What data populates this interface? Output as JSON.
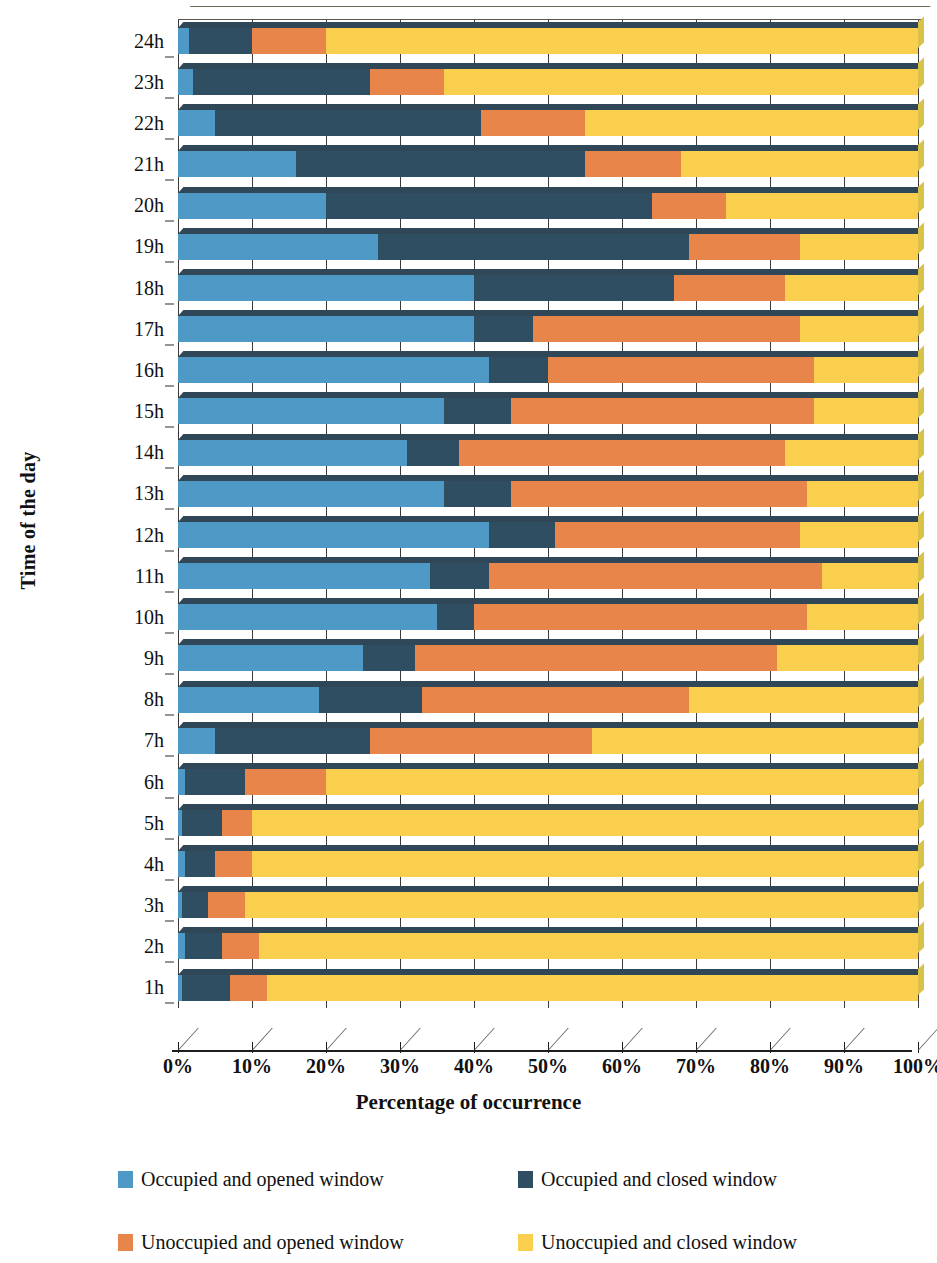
{
  "chart_data": {
    "type": "bar",
    "orientation": "horizontal",
    "stacked": true,
    "normalized_percent": true,
    "title": "",
    "xlabel": "Percentage of occurrence",
    "ylabel": "Time of the day",
    "xlim": [
      0,
      100
    ],
    "grid": true,
    "legend_position": "bottom",
    "xticks": [
      "0%",
      "10%",
      "20%",
      "30%",
      "40%",
      "50%",
      "60%",
      "70%",
      "80%",
      "90%",
      "100%"
    ],
    "xtick_values": [
      0,
      10,
      20,
      30,
      40,
      50,
      60,
      70,
      80,
      90,
      100
    ],
    "categories": [
      "1h",
      "2h",
      "3h",
      "4h",
      "5h",
      "6h",
      "7h",
      "8h",
      "9h",
      "10h",
      "11h",
      "12h",
      "13h",
      "14h",
      "15h",
      "16h",
      "17h",
      "18h",
      "19h",
      "20h",
      "21h",
      "22h",
      "23h",
      "24h"
    ],
    "category_order_top_to_bottom": [
      "24h",
      "23h",
      "22h",
      "21h",
      "20h",
      "19h",
      "18h",
      "17h",
      "16h",
      "15h",
      "14h",
      "13h",
      "12h",
      "11h",
      "10h",
      "9h",
      "8h",
      "7h",
      "6h",
      "5h",
      "4h",
      "3h",
      "2h",
      "1h"
    ],
    "series": [
      {
        "name": "Occupied and opened window",
        "color": "#4f99c6",
        "values": [
          0.5,
          1,
          0.5,
          1,
          0.5,
          1,
          5,
          19,
          25,
          35,
          34,
          42,
          36,
          31,
          36,
          42,
          40,
          40,
          27,
          20,
          16,
          5,
          2,
          1.5
        ]
      },
      {
        "name": "Occupied and closed window",
        "color": "#2f4e62",
        "values": [
          6.5,
          5,
          3.5,
          4,
          5.5,
          8,
          21,
          14,
          7,
          5,
          8,
          9,
          9,
          7,
          9,
          8,
          8,
          27,
          42,
          44,
          39,
          36,
          24,
          8.5
        ]
      },
      {
        "name": "Unoccupied and opened window",
        "color": "#e8854b",
        "values": [
          5,
          5,
          5,
          5,
          4,
          11,
          30,
          36,
          49,
          45,
          45,
          33,
          40,
          44,
          41,
          36,
          36,
          15,
          15,
          10,
          13,
          14,
          10,
          10
        ]
      },
      {
        "name": "Unoccupied and closed window",
        "color": "#f9cf4d",
        "values": [
          88,
          89,
          91,
          90,
          90,
          80,
          44,
          31,
          19,
          15,
          13,
          16,
          15,
          18,
          14,
          14,
          16,
          18,
          16,
          26,
          32,
          45,
          64,
          80
        ]
      }
    ],
    "rows_top_to_bottom": [
      {
        "label": "24h",
        "stops": [
          1.5,
          10,
          20
        ]
      },
      {
        "label": "23h",
        "stops": [
          2,
          26,
          36
        ]
      },
      {
        "label": "22h",
        "stops": [
          5,
          41,
          55
        ]
      },
      {
        "label": "21h",
        "stops": [
          16,
          55,
          68
        ]
      },
      {
        "label": "20h",
        "stops": [
          20,
          64,
          74
        ]
      },
      {
        "label": "19h",
        "stops": [
          27,
          69,
          84
        ]
      },
      {
        "label": "18h",
        "stops": [
          40,
          67,
          82
        ]
      },
      {
        "label": "17h",
        "stops": [
          40,
          48,
          84
        ]
      },
      {
        "label": "16h",
        "stops": [
          42,
          50,
          86
        ]
      },
      {
        "label": "15h",
        "stops": [
          36,
          45,
          86
        ]
      },
      {
        "label": "14h",
        "stops": [
          31,
          38,
          82
        ]
      },
      {
        "label": "13h",
        "stops": [
          36,
          45,
          85
        ]
      },
      {
        "label": "12h",
        "stops": [
          42,
          51,
          84
        ]
      },
      {
        "label": "11h",
        "stops": [
          34,
          42,
          87
        ]
      },
      {
        "label": "10h",
        "stops": [
          35,
          40,
          85
        ]
      },
      {
        "label": "9h",
        "stops": [
          25,
          32,
          81
        ]
      },
      {
        "label": "8h",
        "stops": [
          19,
          33,
          69
        ]
      },
      {
        "label": "7h",
        "stops": [
          5,
          26,
          56
        ]
      },
      {
        "label": "6h",
        "stops": [
          1,
          9,
          20
        ]
      },
      {
        "label": "5h",
        "stops": [
          0.5,
          6,
          10
        ]
      },
      {
        "label": "4h",
        "stops": [
          1,
          5,
          10
        ]
      },
      {
        "label": "3h",
        "stops": [
          0.5,
          4,
          9
        ]
      },
      {
        "label": "2h",
        "stops": [
          1,
          6,
          11
        ]
      },
      {
        "label": "1h",
        "stops": [
          0.5,
          7,
          12
        ]
      }
    ]
  },
  "axes": {
    "y_title": "Time of the day",
    "x_title": "Percentage of occurrence"
  },
  "legend": {
    "items": [
      {
        "label": "Occupied and opened window",
        "color": "#4f99c6"
      },
      {
        "label": "Occupied and closed window",
        "color": "#2f4e62"
      },
      {
        "label": "Unoccupied and opened window",
        "color": "#e8854b"
      },
      {
        "label": "Unoccupied and closed window",
        "color": "#f9cf4d"
      }
    ]
  }
}
